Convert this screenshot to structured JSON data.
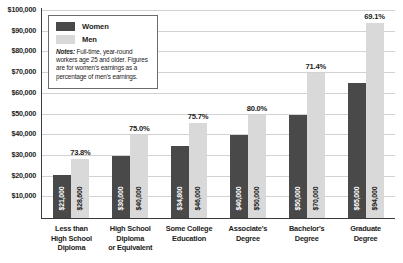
{
  "chart_data": {
    "type": "bar",
    "title": "",
    "subtitle": "",
    "xlabel": "",
    "ylabel": "",
    "ylim": [
      0,
      100000
    ],
    "grid": true,
    "legend_position": "upper-left-inset",
    "categories": [
      "Less than High School Diploma",
      "High School Diploma or Equivalent",
      "Some College Education",
      "Associate's Degree",
      "Bachelor's Degree",
      "Graduate Degree"
    ],
    "category_lines": [
      [
        "Less than",
        "High School",
        "Diploma"
      ],
      [
        "High School",
        "Diploma",
        "or Equivalent"
      ],
      [
        "Some College",
        "Education"
      ],
      [
        "Associate's",
        "Degree"
      ],
      [
        "Bachelor's",
        "Degree"
      ],
      [
        "Graduate",
        "Degree"
      ]
    ],
    "series": [
      {
        "name": "Women",
        "color": "#494949",
        "values": [
          21000,
          30000,
          34800,
          40000,
          50000,
          65000
        ],
        "labels": [
          "$21,000",
          "$30,000",
          "$34,800",
          "$40,000",
          "$50,000",
          "$65,000"
        ]
      },
      {
        "name": "Men",
        "color": "#d9d9d9",
        "values": [
          28600,
          40000,
          46000,
          50000,
          70000,
          94000
        ],
        "labels": [
          "$28,600",
          "$40,000",
          "$46,000",
          "$50,000",
          "$70,000",
          "$94,000"
        ]
      }
    ],
    "annotations": {
      "ratio_labels": [
        "73.8%",
        "75.0%",
        "75.7%",
        "80.0%",
        "71.4%",
        "69.1%"
      ]
    },
    "yticks": [
      10000,
      20000,
      30000,
      40000,
      50000,
      60000,
      70000,
      80000,
      90000,
      100000
    ],
    "ytick_labels": [
      "$10,000",
      "$20,000",
      "$30,000",
      "$40,000",
      "$50,000",
      "$60,000",
      "$70,000",
      "$80,000",
      "$90,000",
      "$100,000"
    ]
  },
  "legend": {
    "items": [
      {
        "label": "Women",
        "color": "#494949"
      },
      {
        "label": "Men",
        "color": "#d9d9d9"
      }
    ],
    "notes_prefix": "Notes:",
    "notes_text": " Full-time, year-round workers age 25 and older. Figures are for women's earnings as a percentage of men's earnings."
  },
  "colors": {
    "women": "#494949",
    "men": "#d9d9d9",
    "grid": "#d2d2d2",
    "axis": "#3a3a3a",
    "text": "#1d1d1b"
  }
}
